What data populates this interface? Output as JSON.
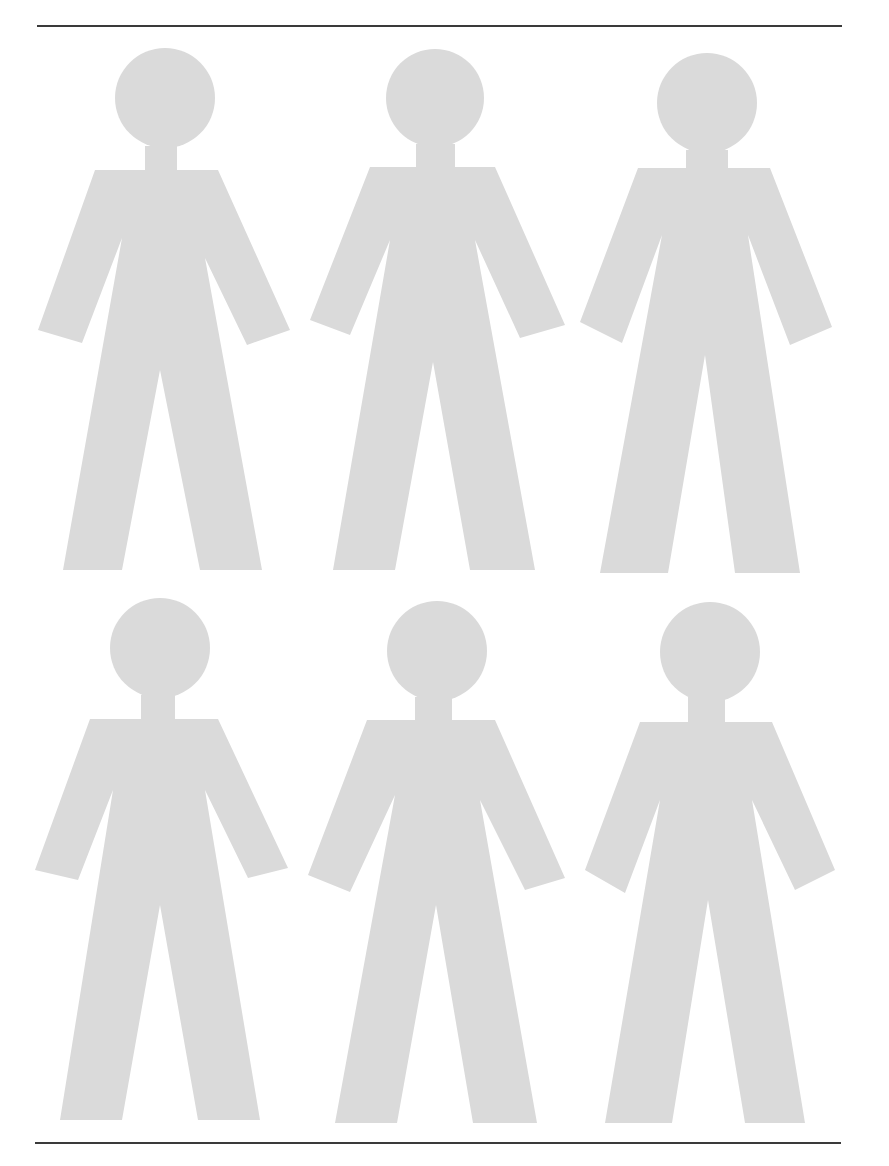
{
  "page": {
    "width": 889,
    "height": 1166,
    "background": "#ffffff",
    "figure_color": "#dadada",
    "rule_color": "#3a3a3a"
  },
  "rules": {
    "top": {
      "x1": 37,
      "y1": 26,
      "x2": 842,
      "y2": 26
    },
    "bottom": {
      "x1": 35,
      "y1": 1143,
      "x2": 841,
      "y2": 1143
    }
  },
  "figures": [
    {
      "id": "figure-1",
      "row": 1,
      "col": 1,
      "head": {
        "cx": 165,
        "cy": 98,
        "r": 50
      },
      "body": [
        [
          145,
          146
        ],
        [
          177,
          146
        ],
        [
          177,
          170
        ],
        [
          218,
          170
        ],
        [
          290,
          330
        ],
        [
          247,
          345
        ],
        [
          205,
          258
        ],
        [
          262,
          570
        ],
        [
          200,
          570
        ],
        [
          160,
          370
        ],
        [
          122,
          570
        ],
        [
          63,
          570
        ],
        [
          122,
          238
        ],
        [
          82,
          343
        ],
        [
          38,
          330
        ],
        [
          95,
          170
        ],
        [
          145,
          170
        ]
      ]
    },
    {
      "id": "figure-2",
      "row": 1,
      "col": 2,
      "head": {
        "cx": 435,
        "cy": 98,
        "r": 49
      },
      "body": [
        [
          416,
          144
        ],
        [
          455,
          144
        ],
        [
          455,
          167
        ],
        [
          495,
          167
        ],
        [
          565,
          325
        ],
        [
          520,
          338
        ],
        [
          475,
          240
        ],
        [
          535,
          570
        ],
        [
          470,
          570
        ],
        [
          433,
          362
        ],
        [
          395,
          570
        ],
        [
          333,
          570
        ],
        [
          390,
          240
        ],
        [
          350,
          335
        ],
        [
          310,
          320
        ],
        [
          370,
          167
        ],
        [
          416,
          167
        ]
      ]
    },
    {
      "id": "figure-3",
      "row": 1,
      "col": 3,
      "head": {
        "cx": 707,
        "cy": 103,
        "r": 50
      },
      "body": [
        [
          686,
          150
        ],
        [
          728,
          150
        ],
        [
          728,
          168
        ],
        [
          770,
          168
        ],
        [
          832,
          327
        ],
        [
          790,
          345
        ],
        [
          748,
          235
        ],
        [
          800,
          573
        ],
        [
          735,
          573
        ],
        [
          705,
          355
        ],
        [
          668,
          573
        ],
        [
          600,
          573
        ],
        [
          662,
          235
        ],
        [
          622,
          343
        ],
        [
          580,
          322
        ],
        [
          638,
          168
        ],
        [
          686,
          168
        ]
      ]
    },
    {
      "id": "figure-4",
      "row": 2,
      "col": 1,
      "head": {
        "cx": 160,
        "cy": 648,
        "r": 50
      },
      "body": [
        [
          141,
          695
        ],
        [
          175,
          695
        ],
        [
          175,
          719
        ],
        [
          218,
          719
        ],
        [
          288,
          868
        ],
        [
          248,
          878
        ],
        [
          205,
          790
        ],
        [
          260,
          1120
        ],
        [
          198,
          1120
        ],
        [
          160,
          905
        ],
        [
          122,
          1120
        ],
        [
          60,
          1120
        ],
        [
          113,
          790
        ],
        [
          78,
          880
        ],
        [
          35,
          870
        ],
        [
          90,
          719
        ],
        [
          141,
          719
        ]
      ]
    },
    {
      "id": "figure-5",
      "row": 2,
      "col": 2,
      "head": {
        "cx": 437,
        "cy": 651,
        "r": 50
      },
      "body": [
        [
          415,
          697
        ],
        [
          452,
          697
        ],
        [
          452,
          720
        ],
        [
          495,
          720
        ],
        [
          565,
          878
        ],
        [
          525,
          890
        ],
        [
          480,
          800
        ],
        [
          537,
          1123
        ],
        [
          473,
          1123
        ],
        [
          436,
          905
        ],
        [
          397,
          1123
        ],
        [
          335,
          1123
        ],
        [
          395,
          795
        ],
        [
          350,
          892
        ],
        [
          308,
          875
        ],
        [
          367,
          720
        ],
        [
          415,
          720
        ]
      ]
    },
    {
      "id": "figure-6",
      "row": 2,
      "col": 3,
      "head": {
        "cx": 710,
        "cy": 652,
        "r": 50
      },
      "body": [
        [
          688,
          697
        ],
        [
          725,
          697
        ],
        [
          725,
          722
        ],
        [
          772,
          722
        ],
        [
          835,
          870
        ],
        [
          795,
          890
        ],
        [
          752,
          800
        ],
        [
          805,
          1123
        ],
        [
          745,
          1123
        ],
        [
          708,
          900
        ],
        [
          672,
          1123
        ],
        [
          605,
          1123
        ],
        [
          660,
          800
        ],
        [
          625,
          893
        ],
        [
          585,
          870
        ],
        [
          640,
          722
        ],
        [
          688,
          722
        ]
      ]
    }
  ]
}
